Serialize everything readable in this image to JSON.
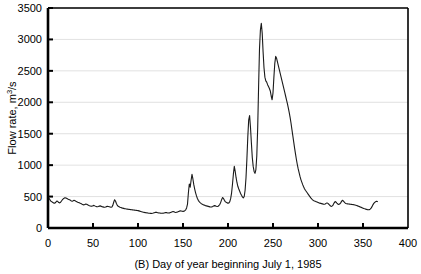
{
  "chart_data": {
    "type": "line",
    "title": "",
    "caption": "(B)  Day of year beginning July 1, 1985",
    "panel_label": "(B)",
    "xlabel": "Day of year beginning July 1, 1985",
    "ylabel_prefix": "Flow rate, m",
    "ylabel_sup": "3",
    "ylabel_suffix": "/s",
    "ylabel_full": "Flow rate, m3/s",
    "xlim": [
      0,
      400
    ],
    "ylim": [
      0,
      3500
    ],
    "xticks": [
      0,
      50,
      100,
      150,
      200,
      250,
      300,
      350,
      400
    ],
    "yticks": [
      0,
      500,
      1000,
      1500,
      2000,
      2500,
      3000,
      3500
    ],
    "xtick_labels": [
      "0",
      "50",
      "100",
      "150",
      "200",
      "250",
      "300",
      "350",
      "400"
    ],
    "ytick_labels": [
      "0",
      "500",
      "1000",
      "1500",
      "2000",
      "2500",
      "3000",
      "3500"
    ],
    "grid": {
      "horizontal": true,
      "vertical": false,
      "color": "#d9d9d9"
    },
    "legend": {
      "visible": false,
      "position": "none"
    },
    "line_color": "#1a1a1a",
    "line_width": 1.1,
    "series": [
      {
        "name": "Flow rate",
        "x": [
          1,
          2,
          3,
          4,
          5,
          6,
          7,
          8,
          9,
          10,
          11,
          12,
          13,
          14,
          15,
          16,
          17,
          18,
          19,
          20,
          21,
          22,
          23,
          24,
          25,
          26,
          27,
          28,
          29,
          30,
          31,
          32,
          33,
          34,
          35,
          36,
          37,
          38,
          39,
          40,
          41,
          42,
          43,
          44,
          45,
          46,
          47,
          48,
          49,
          50,
          51,
          52,
          53,
          54,
          55,
          56,
          57,
          58,
          59,
          60,
          61,
          62,
          63,
          64,
          65,
          66,
          67,
          68,
          69,
          70,
          71,
          72,
          73,
          74,
          75,
          76,
          77,
          78,
          79,
          80,
          81,
          82,
          83,
          84,
          85,
          86,
          87,
          88,
          89,
          90,
          91,
          92,
          93,
          94,
          95,
          96,
          97,
          98,
          99,
          100,
          101,
          102,
          103,
          104,
          105,
          106,
          107,
          108,
          109,
          110,
          111,
          112,
          113,
          114,
          115,
          116,
          117,
          118,
          119,
          120,
          121,
          122,
          123,
          124,
          125,
          126,
          127,
          128,
          129,
          130,
          131,
          132,
          133,
          134,
          135,
          136,
          137,
          138,
          139,
          140,
          141,
          142,
          143,
          144,
          145,
          146,
          147,
          148,
          149,
          150,
          151,
          152,
          153,
          154,
          155,
          156,
          157,
          158,
          159,
          160,
          161,
          162,
          163,
          164,
          165,
          166,
          167,
          168,
          169,
          170,
          171,
          172,
          173,
          174,
          175,
          176,
          177,
          178,
          179,
          180,
          181,
          182,
          183,
          184,
          185,
          186,
          187,
          188,
          189,
          190,
          191,
          192,
          193,
          194,
          195,
          196,
          197,
          198,
          199,
          200,
          201,
          202,
          203,
          204,
          205,
          206,
          207,
          208,
          209,
          210,
          211,
          212,
          213,
          214,
          215,
          216,
          217,
          218,
          219,
          220,
          221,
          222,
          223,
          224,
          225,
          226,
          227,
          228,
          229,
          230,
          231,
          232,
          233,
          234,
          235,
          236,
          237,
          238,
          239,
          240,
          241,
          242,
          243,
          244,
          245,
          246,
          247,
          248,
          249,
          250,
          251,
          252,
          253,
          254,
          255,
          256,
          257,
          258,
          259,
          260,
          261,
          262,
          263,
          264,
          265,
          266,
          267,
          268,
          269,
          270,
          271,
          272,
          273,
          274,
          275,
          276,
          277,
          278,
          279,
          280,
          281,
          282,
          283,
          284,
          285,
          286,
          287,
          288,
          289,
          290,
          291,
          292,
          293,
          294,
          295,
          296,
          297,
          298,
          299,
          300,
          301,
          302,
          303,
          304,
          305,
          306,
          307,
          308,
          309,
          310,
          311,
          312,
          313,
          314,
          315,
          316,
          317,
          318,
          319,
          320,
          321,
          322,
          323,
          324,
          325,
          326,
          327,
          328,
          329,
          330,
          331,
          332,
          333,
          334,
          335,
          336,
          337,
          338,
          339,
          340,
          341,
          342,
          343,
          344,
          345,
          346,
          347,
          348,
          349,
          350,
          351,
          352,
          353,
          354,
          355,
          356,
          357,
          358,
          359,
          360,
          361,
          362,
          363,
          364,
          365,
          366
        ],
        "values": [
          470,
          455,
          430,
          420,
          410,
          400,
          395,
          400,
          415,
          430,
          420,
          405,
          400,
          410,
          430,
          450,
          465,
          475,
          480,
          478,
          470,
          462,
          455,
          448,
          440,
          430,
          425,
          432,
          440,
          435,
          425,
          418,
          410,
          405,
          400,
          392,
          385,
          378,
          372,
          368,
          375,
          382,
          378,
          370,
          362,
          355,
          350,
          345,
          348,
          355,
          360,
          352,
          345,
          340,
          338,
          342,
          348,
          352,
          346,
          340,
          336,
          332,
          330,
          334,
          340,
          345,
          342,
          338,
          334,
          330,
          335,
          360,
          410,
          450,
          430,
          390,
          360,
          345,
          338,
          330,
          325,
          320,
          316,
          312,
          308,
          305,
          302,
          300,
          298,
          296,
          294,
          292,
          290,
          288,
          286,
          284,
          282,
          280,
          278,
          276,
          272,
          268,
          264,
          260,
          256,
          252,
          248,
          245,
          242,
          240,
          238,
          236,
          234,
          233,
          232,
          234,
          238,
          244,
          248,
          250,
          248,
          244,
          240,
          238,
          236,
          235,
          234,
          236,
          240,
          244,
          246,
          244,
          240,
          238,
          240,
          246,
          252,
          258,
          262,
          258,
          252,
          248,
          250,
          256,
          262,
          268,
          272,
          270,
          266,
          264,
          268,
          276,
          290,
          320,
          380,
          560,
          700,
          650,
          760,
          855,
          780,
          690,
          620,
          560,
          510,
          470,
          440,
          420,
          405,
          392,
          382,
          374,
          368,
          362,
          356,
          352,
          348,
          344,
          340,
          336,
          334,
          336,
          342,
          350,
          356,
          352,
          346,
          342,
          346,
          358,
          378,
          412,
          455,
          485,
          470,
          440,
          420,
          408,
          400,
          396,
          400,
          420,
          470,
          560,
          700,
          860,
          980,
          900,
          800,
          720,
          660,
          620,
          585,
          550,
          520,
          495,
          478,
          500,
          600,
          800,
          1100,
          1450,
          1720,
          1790,
          1600,
          1350,
          1120,
          980,
          900,
          870,
          930,
          1150,
          1600,
          2250,
          2850,
          3150,
          3255,
          3100,
          2800,
          2550,
          2400,
          2340,
          2320,
          2280,
          2250,
          2220,
          2180,
          2100,
          2040,
          2150,
          2400,
          2620,
          2730,
          2700,
          2640,
          2580,
          2520,
          2460,
          2400,
          2340,
          2280,
          2220,
          2160,
          2100,
          2040,
          1980,
          1910,
          1840,
          1760,
          1670,
          1570,
          1470,
          1370,
          1270,
          1180,
          1090,
          1010,
          940,
          880,
          820,
          770,
          730,
          690,
          655,
          625,
          600,
          580,
          560,
          540,
          520,
          500,
          480,
          462,
          448,
          438,
          430,
          424,
          418,
          412,
          406,
          400,
          396,
          392,
          388,
          384,
          380,
          378,
          382,
          392,
          400,
          392,
          378,
          362,
          350,
          344,
          352,
          372,
          400,
          420,
          412,
          396,
          382,
          374,
          380,
          396,
          420,
          440,
          432,
          416,
          400,
          390,
          386,
          384,
          382,
          380,
          378,
          376,
          374,
          372,
          370,
          366,
          362,
          358,
          352,
          346,
          340,
          334,
          328,
          322,
          316,
          310,
          305,
          300,
          296,
          292,
          290,
          292,
          300,
          316,
          340,
          368,
          392,
          408,
          418,
          425,
          420
        ]
      }
    ]
  }
}
